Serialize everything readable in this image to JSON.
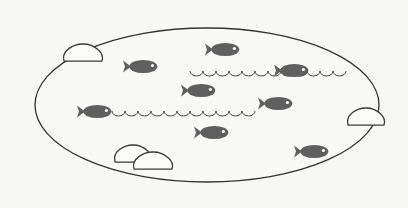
{
  "scene": {
    "title": "Pond with fish",
    "colors": {
      "background": "#f7f7f5",
      "pond_outline": "#333333",
      "pond_fill": "#f9f9f8",
      "fish": "#5f5f5f",
      "fish_eye": "#ffffff",
      "rock_fill": "#fbfbfa",
      "rock_outline": "#3a3a3a",
      "wave": "#444444"
    },
    "pond": {
      "cx": 207,
      "cy": 105,
      "rx": 172,
      "ry": 77
    },
    "fish_count": 8,
    "fish": [
      {
        "x": 123,
        "y": 59,
        "w": 35,
        "h": 15
      },
      {
        "x": 205,
        "y": 42,
        "w": 35,
        "h": 15
      },
      {
        "x": 274,
        "y": 63,
        "w": 35,
        "h": 15
      },
      {
        "x": 181,
        "y": 83,
        "w": 35,
        "h": 15
      },
      {
        "x": 258,
        "y": 96,
        "w": 35,
        "h": 15
      },
      {
        "x": 77,
        "y": 104,
        "w": 35,
        "h": 15
      },
      {
        "x": 194,
        "y": 125,
        "w": 35,
        "h": 15
      },
      {
        "x": 294,
        "y": 144,
        "w": 35,
        "h": 15
      }
    ],
    "rocks": [
      {
        "cx": 83,
        "cy": 55,
        "rx": 19,
        "ry": 11
      },
      {
        "cx": 366,
        "cy": 119,
        "rx": 18,
        "ry": 11
      },
      {
        "cx": 133,
        "cy": 156,
        "rx": 18,
        "ry": 11
      },
      {
        "cx": 153,
        "cy": 163,
        "rx": 19,
        "ry": 11
      }
    ],
    "waves": [
      {
        "x1": 190,
        "x2": 350,
        "y": 72,
        "amp": 4,
        "period": 13
      },
      {
        "x1": 112,
        "x2": 258,
        "y": 112,
        "amp": 4,
        "period": 13
      }
    ]
  }
}
